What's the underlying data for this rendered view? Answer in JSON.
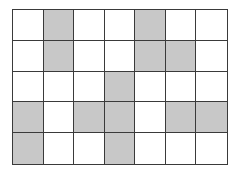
{
  "grid": {
    "rows": 5,
    "cols": 7,
    "shaded_color": "#c8c8c8",
    "empty_color": "#ffffff",
    "line_color": "#3a3a3a",
    "cells": [
      [
        0,
        1,
        0,
        0,
        1,
        0,
        0
      ],
      [
        0,
        1,
        0,
        0,
        1,
        1,
        0
      ],
      [
        0,
        0,
        0,
        1,
        0,
        0,
        0
      ],
      [
        1,
        0,
        1,
        1,
        0,
        1,
        1
      ],
      [
        1,
        0,
        0,
        1,
        0,
        0,
        0
      ]
    ]
  }
}
